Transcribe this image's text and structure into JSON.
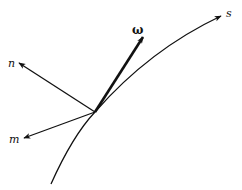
{
  "diagram": {
    "curve": {
      "label": "s"
    },
    "vectors": [
      {
        "id": "omega",
        "label": "ω"
      },
      {
        "id": "n",
        "label": "n"
      },
      {
        "id": "m",
        "label": "m"
      }
    ],
    "colors": {
      "ink": "#111111",
      "background": "#ffffff"
    }
  }
}
